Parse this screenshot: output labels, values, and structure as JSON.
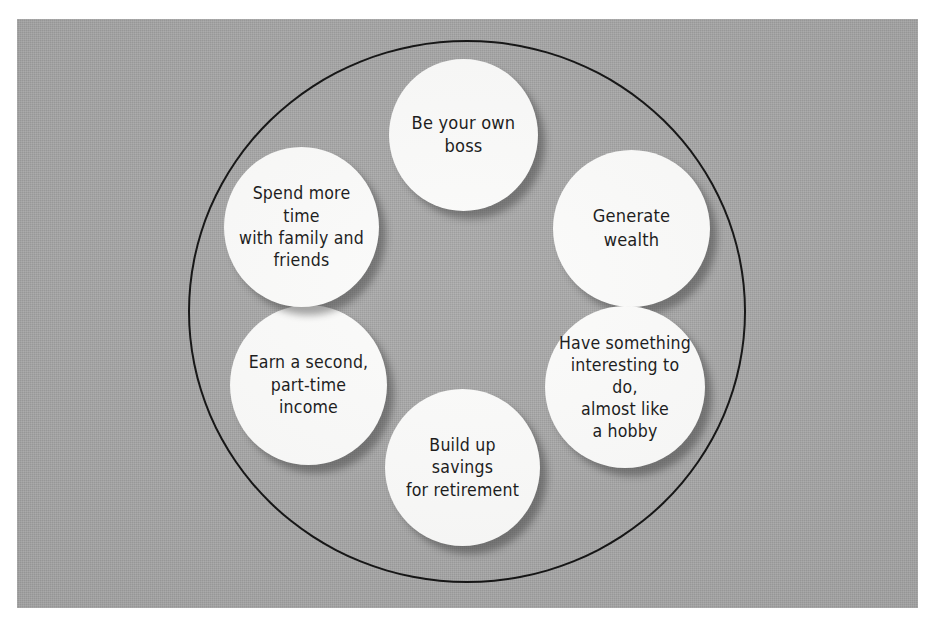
{
  "diagram": {
    "type": "circle-cluster",
    "shape": "outer-ellipse-with-six-bubbles",
    "background_color": "#a6a6a6",
    "bubble_fill_color": "#fbfbfa",
    "outline_color": "#111111",
    "text_color": "#161616",
    "bubble_count": 6,
    "bubbles": [
      {
        "id": "own-boss",
        "position": "top",
        "text": "Be your own boss",
        "lines": [
          "Be your own boss"
        ]
      },
      {
        "id": "wealth",
        "position": "upper-right",
        "text": "Generate wealth",
        "lines": [
          "Generate wealth"
        ]
      },
      {
        "id": "hobby",
        "position": "lower-right",
        "text": "Have something\ninteresting to do,\nalmost like\na hobby",
        "lines": [
          "Have something",
          "interesting to do,",
          "almost like",
          "a hobby"
        ]
      },
      {
        "id": "savings",
        "position": "bottom",
        "text": "Build up savings\nfor retirement",
        "lines": [
          "Build up savings",
          "for retirement"
        ]
      },
      {
        "id": "second-income",
        "position": "lower-left",
        "text": "Earn a second,\npart-time income",
        "lines": [
          "Earn a second,",
          "part-time income"
        ]
      },
      {
        "id": "family",
        "position": "upper-left",
        "text": "Spend more time\nwith family and\nfriends",
        "lines": [
          "Spend more time",
          "with family and",
          "friends"
        ]
      }
    ]
  }
}
